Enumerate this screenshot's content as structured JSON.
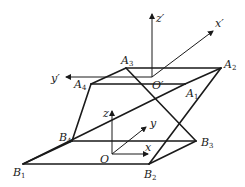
{
  "diagram": {
    "title": "",
    "points": {
      "A1": {
        "label": "A",
        "sub": "1",
        "x": 185,
        "y": 84
      },
      "A2": {
        "label": "A",
        "sub": "2",
        "x": 221,
        "y": 68
      },
      "A3": {
        "label": "A",
        "sub": "3",
        "x": 126,
        "y": 68
      },
      "A4": {
        "label": "A",
        "sub": "4",
        "x": 91,
        "y": 84
      },
      "B1": {
        "label": "B",
        "sub": "1",
        "x": 23,
        "y": 164
      },
      "B2": {
        "label": "B",
        "sub": "2",
        "x": 149,
        "y": 164
      },
      "B3": {
        "label": "B",
        "sub": "3",
        "x": 196,
        "y": 141
      },
      "B4": {
        "label": "B",
        "sub": "4",
        "x": 72,
        "y": 141
      }
    },
    "upper_frame": {
      "origin_label": "O′",
      "x_label": "x′",
      "y_label": "y′",
      "z_label": "z′"
    },
    "lower_frame": {
      "origin_label": "O",
      "x_label": "x",
      "y_label": "y",
      "z_label": "z"
    },
    "edges": [
      [
        "A1",
        "A2"
      ],
      [
        "A2",
        "A3"
      ],
      [
        "A3",
        "A4"
      ],
      [
        "A4",
        "A1"
      ],
      [
        "B1",
        "B2"
      ],
      [
        "B2",
        "B3"
      ],
      [
        "B3",
        "B4"
      ],
      [
        "B4",
        "B1"
      ],
      [
        "A1",
        "B1"
      ],
      [
        "A2",
        "B2"
      ],
      [
        "A3",
        "B3"
      ],
      [
        "A4",
        "B4"
      ]
    ],
    "stroke_color": "#1a1a1a",
    "background": "#ffffff"
  }
}
